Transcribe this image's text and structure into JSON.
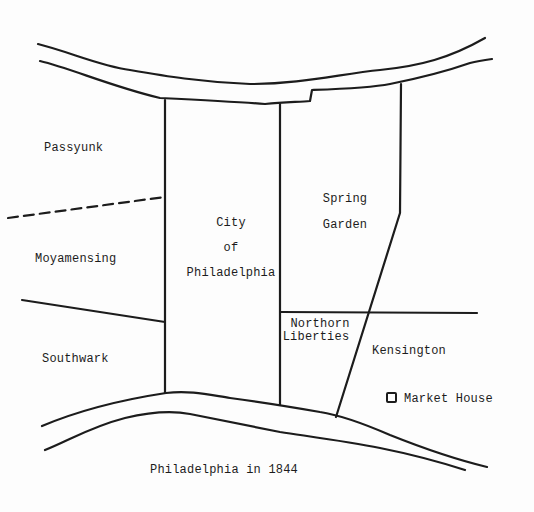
{
  "map": {
    "title": "Philadelphia in 1844",
    "districts": {
      "passyunk": "Passyunk",
      "moyamensing": "Moyamensing",
      "southwark": "Southwark",
      "city_line1": "City",
      "city_line2": "of",
      "city_line3": "Philadelphia",
      "spring_garden_line1": "Spring",
      "spring_garden_line2": "Garden",
      "northern_liberties_line1": "Northorn",
      "northern_liberties_line2": "Liberties",
      "kensington": "Kensington"
    },
    "legend": {
      "icon": "square-marker-icon",
      "label": "Market House"
    },
    "colors": {
      "ink": "#1c1c1c",
      "paper": "#fdfdfd"
    }
  }
}
